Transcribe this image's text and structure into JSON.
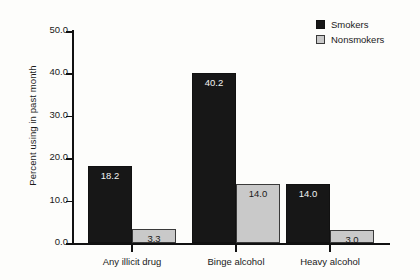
{
  "chart_data": {
    "type": "bar",
    "title": "",
    "xlabel": "",
    "ylabel": "Percent using in past month",
    "ylim": [
      0.0,
      50.0
    ],
    "ytick_labels": [
      "0.0",
      "10.0",
      "20.0",
      "30.0",
      "40.0",
      "50.0"
    ],
    "ytick_values": [
      0.0,
      10.0,
      20.0,
      30.0,
      40.0,
      50.0
    ],
    "grid": false,
    "legend_position": "top-right",
    "categories": [
      "Any illicit drug",
      "Binge alcohol",
      "Heavy alcohol"
    ],
    "series": [
      {
        "name": "Smokers",
        "color": "#171717",
        "values": [
          18.2,
          40.2,
          14.0
        ],
        "value_labels": [
          "18.2",
          "40.2",
          "14.0"
        ]
      },
      {
        "name": "Nonsmokers",
        "color": "#c9c9c9",
        "values": [
          3.3,
          14.0,
          3.0
        ],
        "value_labels": [
          "3.3",
          "14.0",
          "3.0"
        ]
      }
    ]
  },
  "legend": {
    "items": [
      {
        "label": "Smokers",
        "swatch": "smokers-swatch"
      },
      {
        "label": "Nonsmokers",
        "swatch": "nonsmokers-swatch"
      }
    ]
  }
}
